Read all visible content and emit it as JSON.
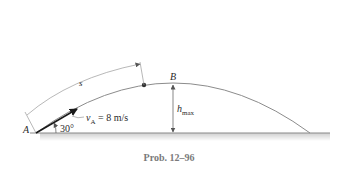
{
  "figure": {
    "caption": "Prob. 12–96",
    "labels": {
      "point_a": "A",
      "point_b": "B",
      "arc_length": "s",
      "velocity_symbol": "v",
      "velocity_subscript": "A",
      "velocity_value": "= 8 m/s",
      "angle": "30°",
      "height_symbol": "h",
      "height_subscript": "max"
    },
    "colors": {
      "ground": "#8a8a8a",
      "ground_shadow": "#d8d8d8",
      "trajectory": "#8c8c8c",
      "arrow": "#1a1a1a",
      "dimension": "#9a9a9a",
      "caption": "#7a7a7a"
    }
  }
}
